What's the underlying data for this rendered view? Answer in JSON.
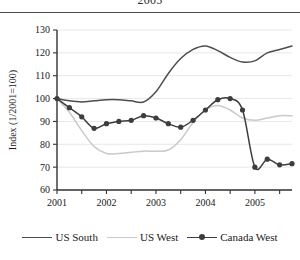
{
  "header": {
    "partial_title": "2005"
  },
  "chart_data": {
    "type": "line",
    "title": "",
    "xlabel": "",
    "ylabel": "Index (1/2001=100)",
    "xlim": [
      2001,
      2005.75
    ],
    "ylim": [
      60,
      130
    ],
    "y_ticks": [
      60,
      70,
      80,
      90,
      100,
      110,
      120,
      130
    ],
    "x_ticks": [
      2001,
      2002,
      2003,
      2004,
      2005
    ],
    "x_minor_ticks": [
      2001.5,
      2002.5,
      2003.5,
      2004.5,
      2005.5
    ],
    "grid": "horizontal",
    "legend_position": "bottom",
    "colors": {
      "us_south": "#4d4d4d",
      "us_west": "#c9c9c9",
      "canada_west": "#3d3d3d",
      "axis": "#333333",
      "gridline": "#e8e8e8"
    },
    "series": [
      {
        "name": "US South",
        "marker": "none",
        "color": "#4d4d4d",
        "x": [
          2001.0,
          2001.25,
          2001.5,
          2001.75,
          2002.0,
          2002.25,
          2002.5,
          2002.75,
          2003.0,
          2003.25,
          2003.5,
          2003.75,
          2004.0,
          2004.25,
          2004.5,
          2004.75,
          2005.0,
          2005.25,
          2005.5,
          2005.75
        ],
        "values": [
          100,
          99,
          98.5,
          99,
          99.5,
          99.5,
          99,
          98.5,
          103,
          111,
          117.5,
          121.5,
          123,
          121,
          118,
          116,
          116.5,
          120,
          121.5,
          123
        ]
      },
      {
        "name": "US West",
        "marker": "none",
        "color": "#c9c9c9",
        "x": [
          2001.0,
          2001.25,
          2001.5,
          2001.75,
          2002.0,
          2002.25,
          2002.5,
          2002.75,
          2003.0,
          2003.25,
          2003.5,
          2003.75,
          2004.0,
          2004.25,
          2004.5,
          2004.75,
          2005.0,
          2005.25,
          2005.5,
          2005.75
        ],
        "values": [
          100,
          94,
          86,
          79,
          76,
          76,
          76.5,
          77,
          77,
          77.5,
          82,
          89.5,
          95,
          97,
          95,
          91.5,
          90.5,
          91.5,
          92.5,
          92.5
        ]
      },
      {
        "name": "Canada West",
        "marker": "circle",
        "color": "#3d3d3d",
        "x": [
          2001.0,
          2001.25,
          2001.5,
          2001.75,
          2002.0,
          2002.25,
          2002.5,
          2002.75,
          2003.0,
          2003.25,
          2003.5,
          2003.75,
          2004.0,
          2004.25,
          2004.5,
          2004.75,
          2005.0,
          2005.25,
          2005.5,
          2005.75
        ],
        "values": [
          100,
          96,
          92,
          87,
          89,
          90,
          90.5,
          92.5,
          91.5,
          89,
          87.5,
          90.5,
          95,
          99.5,
          100,
          95,
          70,
          73.5,
          71,
          71.5
        ]
      }
    ]
  },
  "legend": {
    "entries": [
      {
        "label": "US South"
      },
      {
        "label": "US West"
      },
      {
        "label": "Canada West"
      }
    ]
  }
}
